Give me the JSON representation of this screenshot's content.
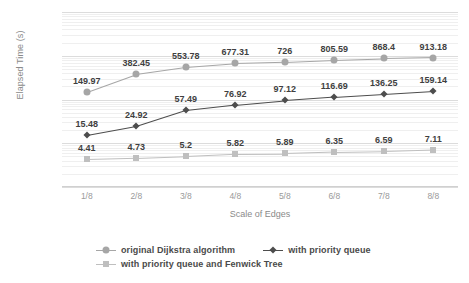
{
  "chart_data": {
    "type": "line",
    "title": "",
    "xlabel": "Scale of Edges",
    "ylabel": "Elapsed Time (s)",
    "categories": [
      "1/8",
      "2/8",
      "3/8",
      "4/8",
      "5/8",
      "6/8",
      "7/8",
      "8/8"
    ],
    "yscale": "log",
    "ylim": [
      1,
      10000
    ],
    "yticks": [
      "1",
      "10",
      "100",
      "1k",
      "10k"
    ],
    "ytick_values": [
      1,
      10,
      100,
      1000,
      10000
    ],
    "grid": true,
    "legend_position": "bottom",
    "series": [
      {
        "name": "original Dijkstra algorithm",
        "color": "#a6a6a6",
        "marker": "circle",
        "values": [
          149.97,
          382.45,
          553.78,
          677.31,
          726,
          805.59,
          868.4,
          913.18
        ],
        "labels": [
          "149.97",
          "382.45",
          "553.78",
          "677.31",
          "726",
          "805.59",
          "868.4",
          "913.18"
        ]
      },
      {
        "name": "with priority queue",
        "color": "#4d4d4d",
        "marker": "diamond",
        "values": [
          15.48,
          24.92,
          57.49,
          76.92,
          97.12,
          116.69,
          136.25,
          159.14
        ],
        "labels": [
          "15.48",
          "24.92",
          "57.49",
          "76.92",
          "97.12",
          "116.69",
          "136.25",
          "159.14"
        ]
      },
      {
        "name": "with priority queue and Fenwick Tree",
        "color": "#bfbfbf",
        "marker": "square",
        "values": [
          4.41,
          4.73,
          5.2,
          5.82,
          5.89,
          6.35,
          6.59,
          7.11
        ],
        "labels": [
          "4.41",
          "4.73",
          "5.2",
          "5.82",
          "5.89",
          "6.35",
          "6.59",
          "7.11"
        ]
      }
    ]
  },
  "legend": {
    "items": [
      {
        "label": "original Dijkstra algorithm"
      },
      {
        "label": "with priority queue"
      },
      {
        "label": "with priority queue and Fenwick Tree"
      }
    ]
  }
}
